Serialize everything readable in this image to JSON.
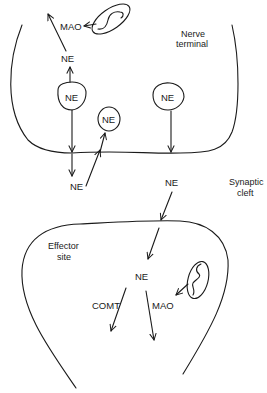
{
  "diagram": {
    "regions": {
      "nerve_terminal": "Nerve terminal",
      "nerve_terminal_line1": "Nerve",
      "nerve_terminal_line2": "terminal",
      "synaptic_cleft_line1": "Synaptic",
      "synaptic_cleft_line2": "cleft",
      "effector_site_line1": "Effector",
      "effector_site_line2": "site"
    },
    "nodes": {
      "mao_top": "MAO",
      "ne_cytoplasm": "NE",
      "vesicle_left": "NE",
      "vesicle_small": "NE",
      "vesicle_right": "NE",
      "ne_cleft_left": "NE",
      "ne_cleft_right": "NE",
      "ne_effector": "NE",
      "comt": "COMT",
      "mao_effector": "MAO"
    },
    "colors": {
      "line": "#1a1a1a",
      "background": "#ffffff"
    }
  }
}
